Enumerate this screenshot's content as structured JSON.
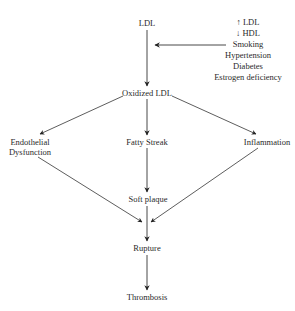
{
  "diagram": {
    "nodes": {
      "ldl": "LDL",
      "oxidized_ldl": "Oxidized LDL",
      "endothelial_line1": "Endothelial",
      "endothelial_line2": "Dysfunction",
      "fatty_streak": "Fatty Streak",
      "inflammation": "Inflammation",
      "soft_plaque": "Soft plaque",
      "rupture": "Rupture",
      "thrombosis": "Thrombosis"
    },
    "risk_factors": [
      "↑ LDL",
      "↓ HDL",
      "Smoking",
      "Hypertension",
      "Diabetes",
      "Estrogen deficiency"
    ],
    "edges": [
      {
        "from": "LDL",
        "to": "Oxidized LDL"
      },
      {
        "from": "Risk factors",
        "to": "LDL→Oxidized LDL"
      },
      {
        "from": "Oxidized LDL",
        "to": "Endothelial Dysfunction"
      },
      {
        "from": "Oxidized LDL",
        "to": "Fatty Streak"
      },
      {
        "from": "Oxidized LDL",
        "to": "Inflammation"
      },
      {
        "from": "Fatty Streak",
        "to": "Soft plaque"
      },
      {
        "from": "Endothelial Dysfunction",
        "to": "Rupture"
      },
      {
        "from": "Inflammation",
        "to": "Rupture"
      },
      {
        "from": "Soft plaque",
        "to": "Rupture"
      },
      {
        "from": "Rupture",
        "to": "Thrombosis"
      }
    ],
    "colors": {
      "line": "#333333",
      "text": "#2a2a2a",
      "background": "#ffffff"
    }
  }
}
